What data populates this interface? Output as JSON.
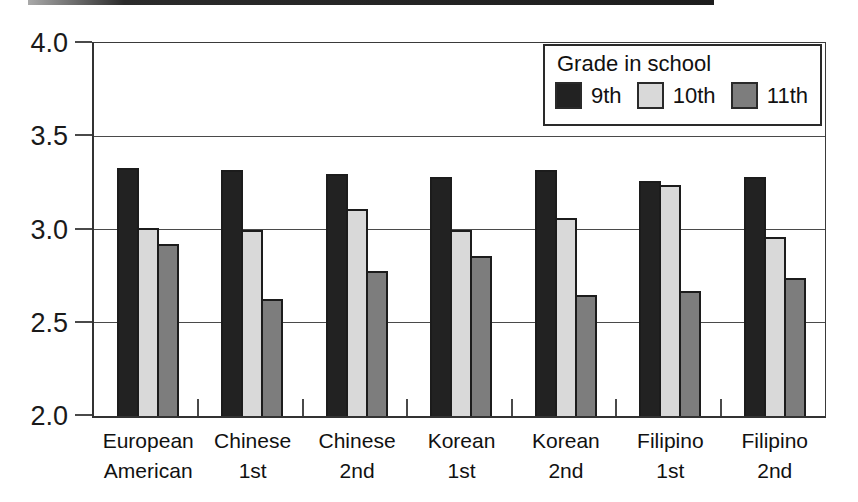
{
  "figure": {
    "background": "#ffffff",
    "top_rule_color": "#1d1d1d",
    "axis_color": "#3a3a3a",
    "bar_outline_color": "#1c1c1c"
  },
  "chart_data": {
    "type": "bar",
    "title": "",
    "legend_title": "Grade in school",
    "legend_position": "top-right",
    "grid": true,
    "ylim": [
      2.0,
      4.0
    ],
    "ytick_labels": [
      "4.0",
      "3.5",
      "3.0",
      "2.5",
      "2.0"
    ],
    "ytick_values": [
      4.0,
      3.5,
      3.0,
      2.5,
      2.0
    ],
    "categories": [
      "European American",
      "Chinese 1st",
      "Chinese 2nd",
      "Korean 1st",
      "Korean 2nd",
      "Filipino 1st",
      "Filipino 2nd"
    ],
    "category_lines": [
      [
        "European",
        "American"
      ],
      [
        "Chinese",
        "1st"
      ],
      [
        "Chinese",
        "2nd"
      ],
      [
        "Korean",
        "1st"
      ],
      [
        "Korean",
        "2nd"
      ],
      [
        "Filipino",
        "1st"
      ],
      [
        "Filipino",
        "2nd"
      ]
    ],
    "series": [
      {
        "name": "9th",
        "color": "#222222",
        "values": [
          3.33,
          3.32,
          3.3,
          3.28,
          3.32,
          3.26,
          3.28
        ]
      },
      {
        "name": "10th",
        "color": "#d9d9d9",
        "values": [
          3.01,
          3.0,
          3.11,
          3.0,
          3.06,
          3.24,
          2.96
        ]
      },
      {
        "name": "11th",
        "color": "#7d7d7d",
        "values": [
          2.92,
          2.63,
          2.78,
          2.86,
          2.65,
          2.67,
          2.74
        ]
      }
    ]
  }
}
